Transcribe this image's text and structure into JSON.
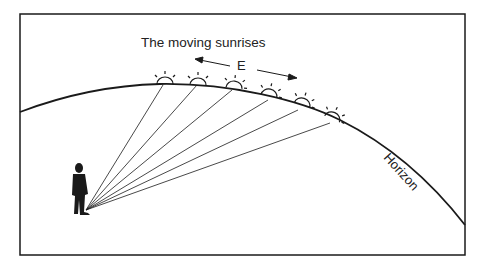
{
  "diagram": {
    "title": "The moving sunrises",
    "direction_label": "E",
    "horizon_label": "Horizon",
    "elements": {
      "observer": "person-silhouette",
      "suns": 6,
      "sight_lines": 6
    },
    "colors": {
      "stroke": "#1a1a1a",
      "background": "#ffffff"
    }
  }
}
